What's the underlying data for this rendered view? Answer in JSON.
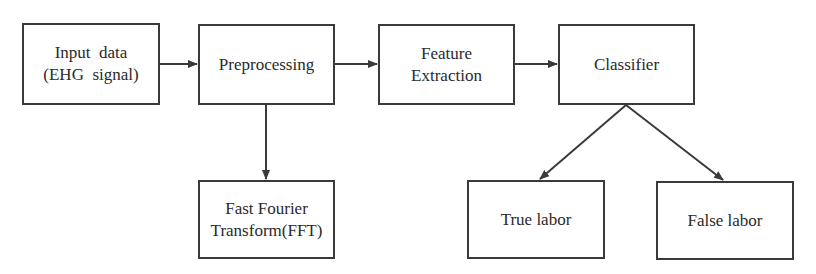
{
  "diagram": {
    "type": "flowchart",
    "colors": {
      "stroke": "#3a3a3a",
      "text": "#2a2a2a",
      "background": "#ffffff"
    },
    "nodes": {
      "input": {
        "line1": "Input  data",
        "line2": "(EHG  signal)"
      },
      "preprocessing": {
        "line1": "Preprocessing"
      },
      "feature": {
        "line1": "Feature",
        "line2": "Extraction"
      },
      "classifier": {
        "line1": "Classifier"
      },
      "fft": {
        "line1": "Fast Fourier",
        "line2": "Transform(FFT)"
      },
      "true_labor": {
        "line1": "True labor"
      },
      "false_labor": {
        "line1": "False labor"
      }
    },
    "edges": [
      {
        "from": "input",
        "to": "preprocessing"
      },
      {
        "from": "preprocessing",
        "to": "feature"
      },
      {
        "from": "feature",
        "to": "classifier"
      },
      {
        "from": "preprocessing",
        "to": "fft"
      },
      {
        "from": "classifier",
        "to": "true_labor"
      },
      {
        "from": "classifier",
        "to": "false_labor"
      }
    ]
  }
}
